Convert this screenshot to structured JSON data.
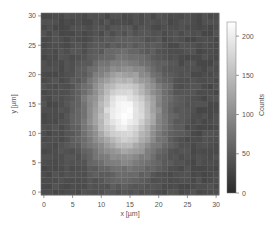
{
  "chart_data": {
    "type": "heatmap",
    "title": "",
    "xlabel": "x [µm]",
    "ylabel": "y [µm]",
    "colorbar_label": "Counts",
    "xlim": [
      -0.5,
      30.5
    ],
    "ylim": [
      -0.5,
      30.5
    ],
    "x_ticks": [
      0,
      5,
      10,
      15,
      20,
      25,
      30
    ],
    "y_ticks": [
      0,
      5,
      10,
      15,
      20,
      25,
      30
    ],
    "colorbar_ticks": [
      0,
      50,
      100,
      150,
      200
    ],
    "colorbar_range": [
      0,
      218
    ],
    "colormap": "gray",
    "colormap_low": "#2a2a2a",
    "colormap_high": "#ffffff",
    "grid": false,
    "legend_position": "right (colorbar)",
    "grid_shape": [
      31,
      31
    ],
    "background_counts": 35,
    "peak_counts": 215,
    "x_amplitude_profile": [
      1,
      1,
      3,
      6,
      11,
      18,
      29,
      45,
      65,
      89,
      114,
      140,
      161,
      175,
      180,
      175,
      161,
      140,
      114,
      89,
      65,
      45,
      29,
      18,
      11,
      6,
      3,
      1,
      1,
      0,
      0
    ],
    "y_profile": [
      0.049,
      0.076,
      0.112,
      0.162,
      0.225,
      0.303,
      0.395,
      0.497,
      0.607,
      0.716,
      0.817,
      0.902,
      0.964,
      0.996,
      0.996,
      0.964,
      0.902,
      0.817,
      0.716,
      0.607,
      0.497,
      0.395,
      0.303,
      0.225,
      0.162,
      0.112,
      0.076,
      0.049,
      0.031,
      0.019,
      0.011
    ],
    "value_formula": "counts[y][x] = background_counts + x_amplitude_profile[x] * y_profile[y]"
  },
  "axes": {
    "x_tick_labels": [
      "0",
      "5",
      "10",
      "15",
      "20",
      "25",
      "30"
    ],
    "y_tick_labels": [
      "0",
      "5",
      "10",
      "15",
      "20",
      "25",
      "30"
    ],
    "colorbar_tick_labels": [
      "0",
      "50",
      "100",
      "150",
      "200"
    ]
  }
}
